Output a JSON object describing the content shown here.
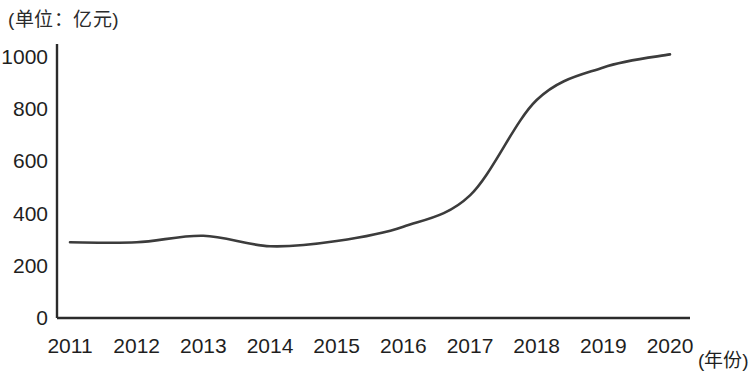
{
  "chart_data": {
    "type": "line",
    "title": "",
    "unit_note": "(单位：亿元)",
    "xlabel": "(年份)",
    "ylabel": "",
    "categories": [
      "2011",
      "2012",
      "2013",
      "2014",
      "2015",
      "2016",
      "2017",
      "2018",
      "2019",
      "2020"
    ],
    "x": [
      2011,
      2012,
      2013,
      2014,
      2015,
      2016,
      2017,
      2018,
      2019,
      2020
    ],
    "values": [
      290,
      290,
      315,
      275,
      295,
      350,
      470,
      835,
      960,
      1010
    ],
    "series": [
      {
        "name": "",
        "values": [
          290,
          290,
          315,
          275,
          295,
          350,
          470,
          835,
          960,
          1010
        ]
      }
    ],
    "ylim": [
      0,
      1000
    ],
    "yticks": [
      0,
      200,
      400,
      600,
      800,
      1000
    ],
    "ytick_labels": [
      "0",
      "200",
      "400",
      "600",
      "800",
      "1000"
    ],
    "xtick_labels": [
      "2011",
      "2012",
      "2013",
      "2014",
      "2015",
      "2016",
      "2017",
      "2018",
      "2019",
      "2020"
    ],
    "grid": false,
    "legend": "none",
    "line_color": "#3c3c3c",
    "axis_color": "#2b2b2b",
    "smoothing": "spline"
  },
  "axes": {
    "unit_note": "(单位：亿元)",
    "x_axis_title": "(年份)"
  }
}
